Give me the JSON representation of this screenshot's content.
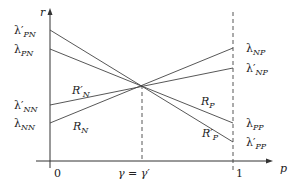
{
  "diagram": {
    "type": "threshold-line-diagram",
    "axes": {
      "y_label": "r",
      "x_label": "p",
      "x_ticks": [
        "0",
        "γ = γ′",
        "1"
      ]
    },
    "left_labels": {
      "lambda_pn_prime": {
        "base": "λ′",
        "sub": "PN"
      },
      "lambda_pn": {
        "base": "λ",
        "sub": "PN"
      },
      "lambda_nn_prime": {
        "base": "λ′",
        "sub": "NN"
      },
      "lambda_nn": {
        "base": "λ",
        "sub": "NN"
      }
    },
    "right_labels": {
      "lambda_np": {
        "base": "λ",
        "sub": "NP"
      },
      "lambda_np_prime": {
        "base": "λ′",
        "sub": "NP"
      },
      "lambda_pp": {
        "base": "λ",
        "sub": "PP"
      },
      "lambda_pp_prime": {
        "base": "λ′",
        "sub": "PP"
      }
    },
    "line_labels": {
      "r_n_prime": {
        "base": "R′",
        "sub": "N"
      },
      "r_n": {
        "base": "R",
        "sub": "N"
      },
      "r_p": {
        "base": "R",
        "sub": "P"
      },
      "r_p_prime": {
        "base": "R′",
        "sub": "P"
      }
    },
    "lines": [
      {
        "name": "R_P_prime",
        "from": "λ′PN",
        "to": "λ′PP"
      },
      {
        "name": "R_P",
        "from": "λPN",
        "to": "λPP"
      },
      {
        "name": "R_N_prime",
        "from": "λ′NN",
        "to": "λ′NP"
      },
      {
        "name": "R_N",
        "from": "λNN",
        "to": "λNP"
      }
    ],
    "intersection": "γ = γ′"
  }
}
